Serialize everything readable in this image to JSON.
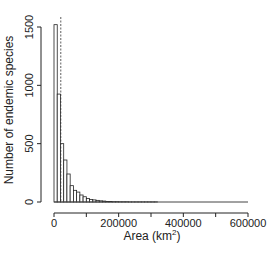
{
  "chart_data": {
    "type": "bar",
    "title": "",
    "xlabel": "Area (km²)",
    "xlabel_main": "Area (km",
    "xlabel_sup": "2",
    "xlabel_close": ")",
    "ylabel": "Number of endemic species",
    "xlim": [
      0,
      600000
    ],
    "ylim": [
      0,
      1500
    ],
    "xticks": [
      0,
      200000,
      400000,
      600000
    ],
    "xtick_labels": [
      "0",
      "200000",
      "400000",
      "600000"
    ],
    "xticks_minor": [
      100000,
      300000,
      500000
    ],
    "yticks": [
      0,
      500,
      1000,
      1500
    ],
    "ytick_labels": [
      "0",
      "500",
      "1000",
      "1500"
    ],
    "grid": false,
    "legend": null,
    "bin_width": 10000,
    "bin_starts": [
      0,
      10000,
      20000,
      30000,
      40000,
      50000,
      60000,
      70000,
      80000,
      90000,
      100000,
      110000,
      120000,
      130000,
      140000,
      150000,
      160000,
      170000,
      180000,
      190000,
      200000,
      210000,
      220000,
      230000,
      240000,
      250000,
      260000,
      270000,
      280000,
      290000,
      300000,
      310000
    ],
    "values": [
      1520,
      925,
      500,
      360,
      240,
      140,
      100,
      85,
      60,
      45,
      30,
      22,
      18,
      14,
      10,
      8,
      5,
      4,
      3,
      3,
      2,
      2,
      2,
      1,
      1,
      1,
      1,
      1,
      1,
      1,
      1,
      1
    ],
    "annotations": [
      {
        "type": "vertical-dashed-line",
        "x": 21000,
        "description": "dashed reference line near median area"
      }
    ]
  }
}
